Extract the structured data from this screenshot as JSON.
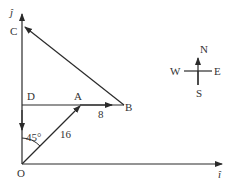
{
  "diagram": {
    "axes": {
      "x_label": "î",
      "y_label": "ĵ"
    },
    "points": {
      "O": "O",
      "A": "A",
      "B": "B",
      "C": "C",
      "D": "D"
    },
    "labels": {
      "angle": "45°",
      "OA_length": "16",
      "AB_length": "8"
    },
    "compass": {
      "north": "N",
      "south": "S",
      "east": "E",
      "west": "W"
    },
    "colors": {
      "line": "#2a2a2a",
      "text": "#333333"
    }
  }
}
